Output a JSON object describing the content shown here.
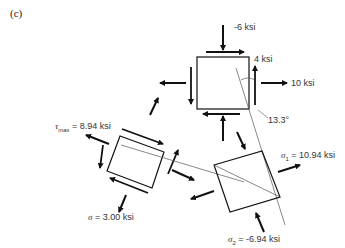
{
  "panel_label": "(c)",
  "original_element": {
    "sigma_y": "-6 ksi",
    "tau": "4 ksi",
    "sigma_x": "10 ksi",
    "angle": "13.3°"
  },
  "max_shear_element": {
    "tau_max_symbol": "τ",
    "tau_max_sub": "max",
    "tau_max_value": "= 8.94 ksi",
    "sigma_symbol": "σ",
    "sigma_value": "= 3.00 ksi"
  },
  "principal_element": {
    "sigma1_symbol": "σ",
    "sigma1_sub": "1",
    "sigma1_value": "= 10.94 ksi",
    "sigma2_symbol": "σ",
    "sigma2_sub": "2",
    "sigma2_value": "= -6.94 ksi"
  }
}
